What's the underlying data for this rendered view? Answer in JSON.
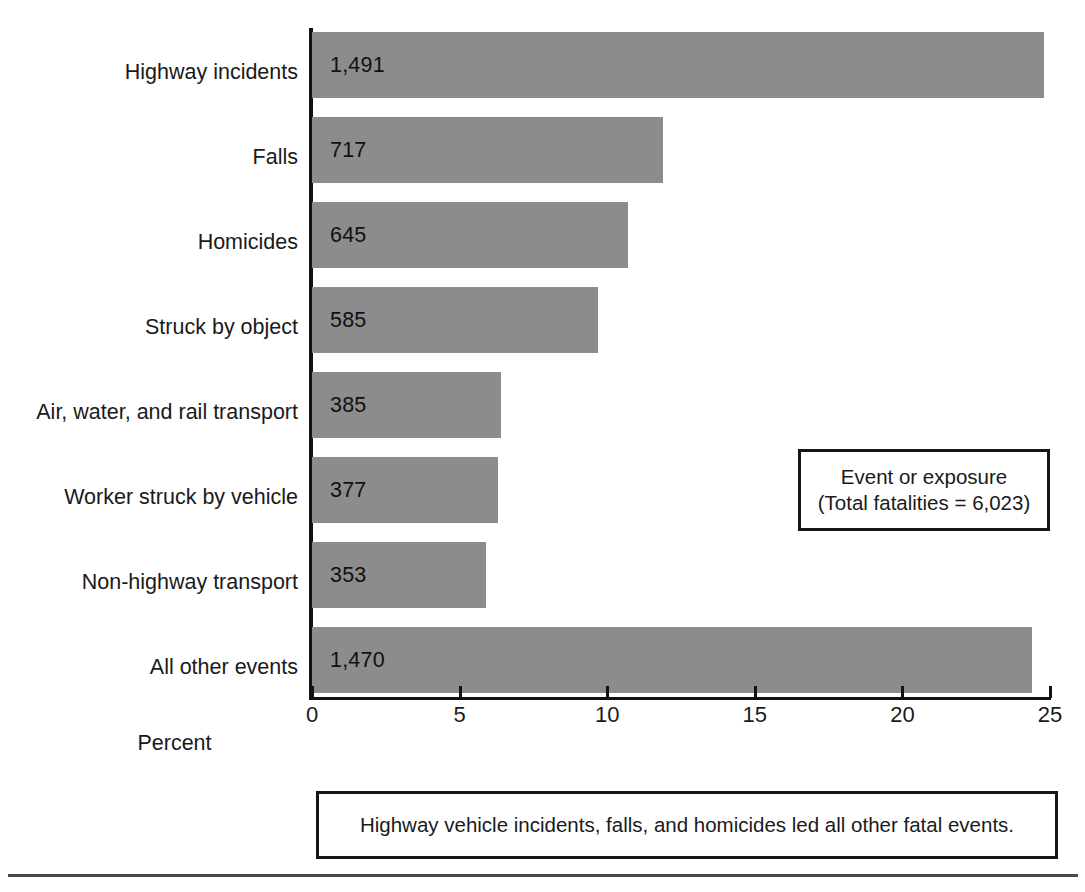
{
  "chart_data": {
    "type": "bar",
    "orientation": "horizontal",
    "title": "",
    "xlabel": "Percent",
    "ylabel": "",
    "xlim": [
      0,
      25
    ],
    "xticks": [
      0,
      5,
      10,
      15,
      20,
      25
    ],
    "xtick_labels": [
      "0",
      "5",
      "10",
      "15",
      "20",
      "25"
    ],
    "grid": false,
    "bar_color": "#8c8c8c",
    "categories": [
      "Highway incidents",
      "Falls",
      "Homicides",
      "Struck by object",
      "Air, water, and rail transport",
      "Worker struck by vehicle",
      "Non-highway transport",
      "All other events"
    ],
    "values": [
      24.8,
      11.9,
      10.7,
      9.7,
      6.4,
      6.3,
      5.9,
      24.4
    ],
    "data_labels": [
      "1,491",
      "717",
      "645",
      "585",
      "385",
      "377",
      "353",
      "1,470"
    ],
    "counts": [
      1491,
      717,
      645,
      585,
      385,
      377,
      353,
      1470
    ],
    "legend": {
      "position": "inside-right",
      "line1": "Event or exposure",
      "line2": "(Total fatalities = 6,023)",
      "total_fatalities": "6,023"
    },
    "annotations": [
      "Highway vehicle incidents, falls, and homicides led all other fatal events."
    ]
  },
  "caption": {
    "text": "Highway vehicle incidents, falls, and homicides led all other fatal events."
  }
}
